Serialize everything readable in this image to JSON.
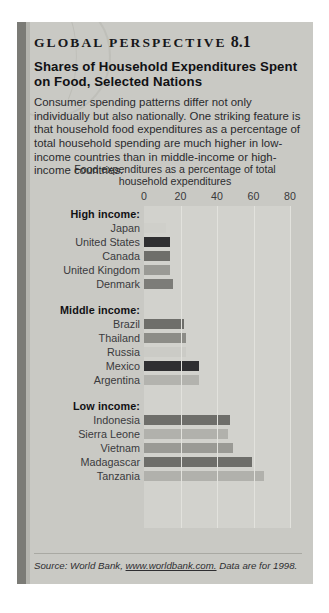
{
  "header": {
    "kicker": "GLOBAL  PERSPECTIVE",
    "number": "8.1",
    "title": "Shares of Household Expenditures Spent on Food, Selected Nations",
    "body": "Consumer spending patterns differ not only individually but also nationally. One striking feature is that household food expenditures as a percentage of total household spending are much higher in low-income countries than in middle-income or high-income countries."
  },
  "source": {
    "prefix": "Source: World Bank, ",
    "link": "www.worldbank.com.",
    "suffix": " Data are for 1998."
  },
  "chart_data": {
    "type": "bar",
    "orientation": "horizontal",
    "title": "Food expenditures as a percentage of total household expenditures",
    "xlabel": "",
    "ylabel": "",
    "xlim": [
      0,
      90
    ],
    "xticks": [
      0,
      20,
      40,
      60,
      80
    ],
    "xticklabels": [
      "0",
      "20",
      "40",
      "60",
      "80"
    ],
    "grid": true,
    "groups": [
      {
        "label": "High income:",
        "items": [
          {
            "label": "Japan",
            "value": 12,
            "color": "#cfcfca"
          },
          {
            "label": "United States",
            "value": 14,
            "color": "#2f2f31"
          },
          {
            "label": "Canada",
            "value": 14,
            "color": "#6e6e6a"
          },
          {
            "label": "United Kingdom",
            "value": 14,
            "color": "#9a9a95"
          },
          {
            "label": "Denmark",
            "value": 16,
            "color": "#7c7c78"
          }
        ]
      },
      {
        "label": "Middle income:",
        "items": [
          {
            "label": "Brazil",
            "value": 22,
            "color": "#6e6e6a"
          },
          {
            "label": "Thailand",
            "value": 23,
            "color": "#8c8c87"
          },
          {
            "label": "Russia",
            "value": 23,
            "color": "#cbcbc6"
          },
          {
            "label": "Mexico",
            "value": 30,
            "color": "#2f2f31"
          },
          {
            "label": "Argentina",
            "value": 30,
            "color": "#b3b3ae"
          }
        ]
      },
      {
        "label": "Low income:",
        "items": [
          {
            "label": "Indonesia",
            "value": 47,
            "color": "#6e6e6a"
          },
          {
            "label": "Sierra Leone",
            "value": 46,
            "color": "#b1b1ac"
          },
          {
            "label": "Vietnam",
            "value": 49,
            "color": "#9a9a95"
          },
          {
            "label": "Madagascar",
            "value": 59,
            "color": "#6e6e6a"
          },
          {
            "label": "Tanzania",
            "value": 66,
            "color": "#b1b1ac"
          }
        ]
      }
    ]
  }
}
